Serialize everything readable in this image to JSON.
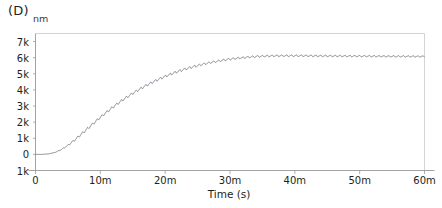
{
  "figure": {
    "panel_label": "(D)",
    "unit_label": "nm"
  },
  "chart_data": {
    "type": "line",
    "title": "(D)",
    "xlabel": "Time (s)",
    "ylabel": "nm",
    "grid": false,
    "legend": null,
    "xlim": [
      0,
      3600
    ],
    "ylim": [
      -1000,
      7500
    ],
    "x_tick_values": [
      0,
      600,
      1200,
      1800,
      2400,
      3000,
      3600
    ],
    "x_tick_labels": [
      "0",
      "10m",
      "20m",
      "30m",
      "40m",
      "50m",
      "60m"
    ],
    "y_tick_values": [
      7000,
      6000,
      5000,
      4000,
      3000,
      2000,
      1000,
      0,
      -1000
    ],
    "y_tick_labels": [
      "7k",
      "6k",
      "5k",
      "4k",
      "3k",
      "2k",
      "1k",
      "0",
      "1k"
    ],
    "line_color": "#6b6f7a",
    "axis_color": "#9a9a9a",
    "series": [
      {
        "name": "displacement",
        "description": "Sawtooth-rippled saturating rise from 0 nm to a ~6.1k nm plateau",
        "x": [
          0,
          60,
          120,
          180,
          240,
          300,
          360,
          420,
          480,
          540,
          600,
          660,
          720,
          780,
          840,
          900,
          960,
          1020,
          1080,
          1140,
          1200,
          1260,
          1320,
          1380,
          1440,
          1500,
          1560,
          1620,
          1680,
          1740,
          1800,
          1860,
          1920,
          1980,
          2040,
          2100,
          2160,
          2220,
          2280,
          2340,
          2400,
          2460,
          2520,
          2580,
          2640,
          2700,
          2760,
          2820,
          2880,
          2940,
          3000,
          3060,
          3120,
          3180,
          3240,
          3300,
          3360,
          3420,
          3480,
          3540,
          3600
        ],
        "y": [
          0,
          0,
          30,
          120,
          300,
          560,
          880,
          1230,
          1590,
          1950,
          2300,
          2630,
          2950,
          3250,
          3530,
          3790,
          4030,
          4260,
          4470,
          4660,
          4840,
          5000,
          5150,
          5280,
          5400,
          5510,
          5610,
          5700,
          5780,
          5850,
          5910,
          5960,
          6000,
          6040,
          6070,
          6090,
          6105,
          6115,
          6120,
          6122,
          6120,
          6118,
          6115,
          6112,
          6110,
          6108,
          6105,
          6103,
          6100,
          6098,
          6095,
          6093,
          6090,
          6088,
          6086,
          6084,
          6082,
          6080,
          6078,
          6076,
          6075
        ],
        "ripple": {
          "shape": "sawtooth",
          "period_seconds": 45,
          "amplitude_nm": 160
        }
      }
    ]
  }
}
